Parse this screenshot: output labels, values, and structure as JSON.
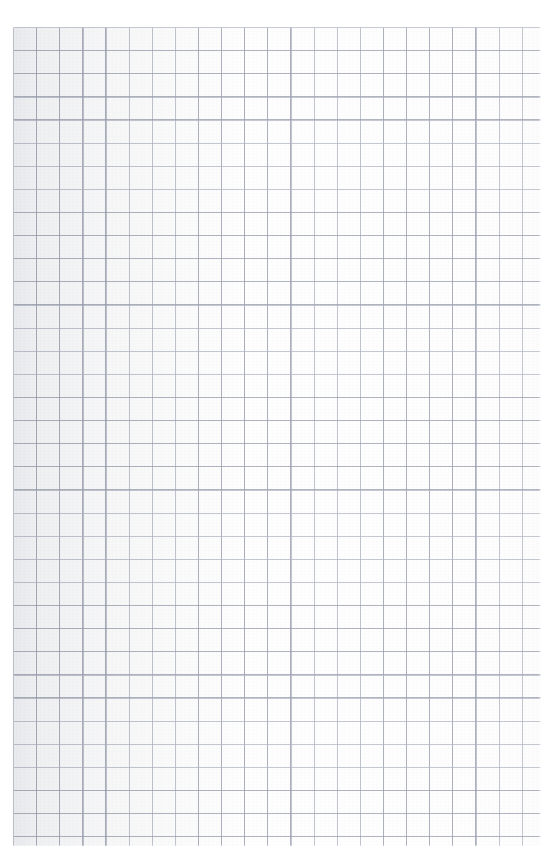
{
  "document": {
    "kind": "scanned-graph-paper",
    "description": "Blank sheet of square-ruled graph paper",
    "width_px": 554,
    "height_px": 866,
    "has_text": false,
    "has_handwriting": false,
    "has_ui_controls": false
  },
  "paper": {
    "background_color": "#fefefe",
    "tint": "neutral-white",
    "texture": "light scan grain"
  },
  "grid": {
    "type": "square-ruled",
    "cell_size_px": 23.12,
    "line_color": "#969baa",
    "line_secondary_color": "#b0b5c2",
    "line_width_px": 1,
    "columns": 23,
    "rows": 36,
    "origin_x_px": 13,
    "origin_y_px": 27,
    "region_width_px": 528,
    "region_height_px": 819,
    "emphasis_lines": false,
    "major_gridline_interval": 0
  },
  "margins": {
    "top_px": 26,
    "bottom_px": 19,
    "left_px": 12,
    "right_px": 13,
    "color": "#ffffff"
  },
  "scan_artifacts": {
    "left_edge_shadow": true,
    "vignette": "subtle",
    "line_irregularity": "slight"
  }
}
